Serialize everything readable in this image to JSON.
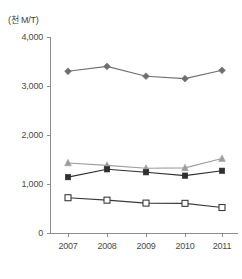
{
  "axis": {
    "unit_label": "(천 M/T)",
    "y_ticks": [
      "4,000",
      "3,000",
      "2,000",
      "1,000",
      "0"
    ],
    "x_ticks": [
      "2007",
      "2008",
      "2009",
      "2010",
      "2011"
    ]
  },
  "colors": {
    "diamond_series": "#6f6f6f",
    "triangle_series": "#9d9d9d",
    "filled_square_series": "#2f2f2f",
    "hollow_square_series": "#3a3a3a",
    "axis": "#8d8d8d",
    "text": "#4a4a4a",
    "background": "#ffffff"
  },
  "chart_data": {
    "type": "line",
    "title": "",
    "xlabel": "",
    "ylabel": "(천 M/T)",
    "categories": [
      "2007",
      "2008",
      "2009",
      "2010",
      "2011"
    ],
    "x": [
      2007,
      2008,
      2009,
      2010,
      2011
    ],
    "ylim": [
      0,
      4000
    ],
    "yticks": [
      0,
      1000,
      2000,
      3000,
      4000
    ],
    "grid": false,
    "legend": "none",
    "series": [
      {
        "name": "diamond-series",
        "marker": "diamond-filled",
        "color": "#6f6f6f",
        "values": [
          3300,
          3400,
          3200,
          3150,
          3320
        ]
      },
      {
        "name": "triangle-series",
        "marker": "triangle-filled",
        "color": "#9d9d9d",
        "values": [
          1430,
          1380,
          1320,
          1330,
          1520
        ]
      },
      {
        "name": "filled-square-series",
        "marker": "square-filled",
        "color": "#2f2f2f",
        "values": [
          1140,
          1300,
          1240,
          1170,
          1270
        ]
      },
      {
        "name": "hollow-square-series",
        "marker": "square-hollow",
        "color": "#3a3a3a",
        "values": [
          720,
          670,
          610,
          605,
          520
        ]
      }
    ]
  }
}
